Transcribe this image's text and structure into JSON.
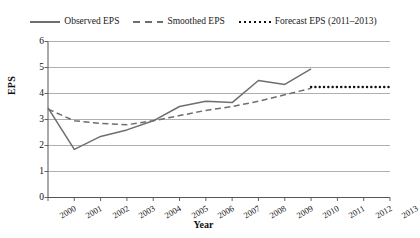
{
  "legend": {
    "items": [
      {
        "label": "Observed EPS",
        "style": "solid",
        "color": "#6e6e6e"
      },
      {
        "label": "Smoothed EPS",
        "style": "dashed",
        "color": "#6e6e6e"
      },
      {
        "label": "Forecast EPS (2011–2013)",
        "style": "dotted",
        "color": "#111111"
      }
    ]
  },
  "chart_data": {
    "type": "line",
    "title": "",
    "xlabel": "Year",
    "ylabel": "EPS",
    "categories": [
      "2000",
      "2001",
      "2002",
      "2003",
      "2004",
      "2005",
      "2006",
      "2007",
      "2008",
      "2009",
      "2010",
      "2011",
      "2012",
      "2013"
    ],
    "x": [
      2000,
      2001,
      2002,
      2003,
      2004,
      2005,
      2006,
      2007,
      2008,
      2009,
      2010,
      2011,
      2012,
      2013
    ],
    "xlim": [
      2000,
      2013
    ],
    "ylim": [
      0,
      6
    ],
    "yticks": [
      0,
      1,
      2,
      3,
      4,
      5,
      6
    ],
    "grid": "horizontal",
    "legend_position": "top-center",
    "series": [
      {
        "name": "Observed EPS",
        "style": "solid",
        "color": "#6e6e6e",
        "x": [
          2000,
          2001,
          2002,
          2003,
          2004,
          2005,
          2006,
          2007,
          2008,
          2009,
          2010
        ],
        "values": [
          3.45,
          1.85,
          2.35,
          2.6,
          2.95,
          3.5,
          3.7,
          3.65,
          4.5,
          4.35,
          4.95
        ]
      },
      {
        "name": "Smoothed EPS",
        "style": "dashed",
        "color": "#6e6e6e",
        "x": [
          2000,
          2001,
          2002,
          2003,
          2004,
          2005,
          2006,
          2007,
          2008,
          2009,
          2010
        ],
        "values": [
          3.4,
          2.95,
          2.85,
          2.8,
          2.95,
          3.15,
          3.35,
          3.5,
          3.7,
          3.95,
          4.2
        ]
      },
      {
        "name": "Forecast EPS (2011–2013)",
        "style": "dotted",
        "color": "#111111",
        "x": [
          2010,
          2011,
          2012,
          2013
        ],
        "values": [
          4.25,
          4.25,
          4.25,
          4.25
        ]
      }
    ]
  }
}
